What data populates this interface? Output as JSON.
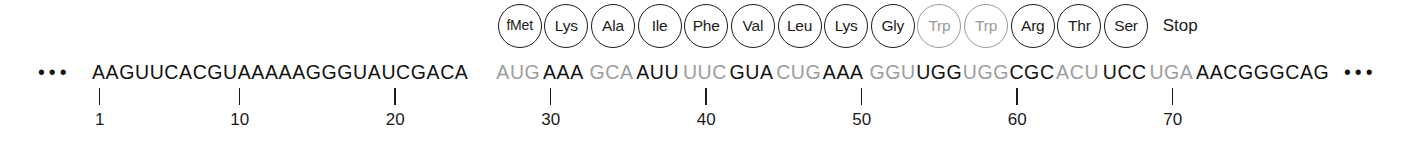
{
  "figure": {
    "leading_ellipsis": "•••",
    "trailing_ellipsis": "•••",
    "stop_label": "Stop",
    "colors": {
      "ink": "#121212",
      "gray": "#9d9d9d",
      "background": "#ffffff"
    }
  },
  "chart_data": {
    "type": "table",
    "xlabel": "Nucleotide position",
    "ylabel": "",
    "grid": false,
    "legend": "none",
    "xlim": [
      1,
      80
    ],
    "sequence_full": "AAGUUCACGUAAAAAGGGUAUCGACAAUGAAAGCAAUUUUCGUACUGAAAGGUUGGUGGCGCACUUCCUGAAACGGGCAG",
    "sequence_length": 80,
    "reading_frame_start": 27,
    "reading_frame_end": 71,
    "segments": [
      {
        "text": "AAGUUCACGUAAAAAGGGUAUCGACA",
        "color": "black",
        "start": 1,
        "end": 26,
        "kind": "utr"
      },
      {
        "text": "AUG",
        "color": "gray",
        "start": 27,
        "end": 29,
        "kind": "codon",
        "amino_acid": "fMet"
      },
      {
        "text": "AAA",
        "color": "black",
        "start": 30,
        "end": 32,
        "kind": "codon",
        "amino_acid": "Lys"
      },
      {
        "text": "GCA",
        "color": "gray",
        "start": 33,
        "end": 35,
        "kind": "codon",
        "amino_acid": "Ala"
      },
      {
        "text": "AUU",
        "color": "black",
        "start": 36,
        "end": 38,
        "kind": "codon",
        "amino_acid": "Ile"
      },
      {
        "text": "UUC",
        "color": "gray",
        "start": 39,
        "end": 41,
        "kind": "codon",
        "amino_acid": "Phe"
      },
      {
        "text": "GUA",
        "color": "black",
        "start": 42,
        "end": 44,
        "kind": "codon",
        "amino_acid": "Val"
      },
      {
        "text": "CUG",
        "color": "gray",
        "start": 45,
        "end": 47,
        "kind": "codon",
        "amino_acid": "Leu"
      },
      {
        "text": "AAA",
        "color": "black",
        "start": 48,
        "end": 50,
        "kind": "codon",
        "amino_acid": "Lys"
      },
      {
        "text": "GGU",
        "color": "gray",
        "start": 51,
        "end": 53,
        "kind": "codon",
        "amino_acid": "Gly"
      },
      {
        "text": "UGG",
        "color": "black",
        "start": 54,
        "end": 56,
        "kind": "codon",
        "amino_acid": "Trp"
      },
      {
        "text": "UGG",
        "color": "gray",
        "start": 57,
        "end": 59,
        "kind": "codon",
        "amino_acid": "Trp"
      },
      {
        "text": "CGC",
        "color": "black",
        "start": 60,
        "end": 62,
        "kind": "codon",
        "amino_acid": "Arg"
      },
      {
        "text": "ACU",
        "color": "gray",
        "start": 63,
        "end": 65,
        "kind": "codon",
        "amino_acid": "Thr"
      },
      {
        "text": "UCC",
        "color": "black",
        "start": 66,
        "end": 68,
        "kind": "codon",
        "amino_acid": "Ser"
      },
      {
        "text": "UGA",
        "color": "gray",
        "start": 69,
        "end": 71,
        "kind": "codon",
        "amino_acid": "Stop"
      },
      {
        "text": "AACGGGCAG",
        "color": "black",
        "start": 72,
        "end": 80,
        "kind": "utr"
      }
    ],
    "amino_acids": [
      {
        "label": "fMet",
        "color": "black",
        "codon": "AUG",
        "codon_start": 27
      },
      {
        "label": "Lys",
        "color": "black",
        "codon": "AAA",
        "codon_start": 30
      },
      {
        "label": "Ala",
        "color": "black",
        "codon": "GCA",
        "codon_start": 33
      },
      {
        "label": "Ile",
        "color": "black",
        "codon": "AUU",
        "codon_start": 36
      },
      {
        "label": "Phe",
        "color": "black",
        "codon": "UUC",
        "codon_start": 39
      },
      {
        "label": "Val",
        "color": "black",
        "codon": "GUA",
        "codon_start": 42
      },
      {
        "label": "Leu",
        "color": "black",
        "codon": "CUG",
        "codon_start": 45
      },
      {
        "label": "Lys",
        "color": "black",
        "codon": "AAA",
        "codon_start": 48
      },
      {
        "label": "Gly",
        "color": "black",
        "codon": "GGU",
        "codon_start": 51
      },
      {
        "label": "Trp",
        "color": "gray",
        "codon": "UGG",
        "codon_start": 54
      },
      {
        "label": "Trp",
        "color": "gray",
        "codon": "UGG",
        "codon_start": 57
      },
      {
        "label": "Arg",
        "color": "black",
        "codon": "CGC",
        "codon_start": 60
      },
      {
        "label": "Thr",
        "color": "black",
        "codon": "ACU",
        "codon_start": 63
      },
      {
        "label": "Ser",
        "color": "black",
        "codon": "UCC",
        "codon_start": 66
      }
    ],
    "ticks": [
      {
        "label": "1",
        "position": 1
      },
      {
        "label": "10",
        "position": 10
      },
      {
        "label": "20",
        "position": 20
      },
      {
        "label": "30",
        "position": 30
      },
      {
        "label": "40",
        "position": 40
      },
      {
        "label": "50",
        "position": 50
      },
      {
        "label": "60",
        "position": 60
      },
      {
        "label": "70",
        "position": 70
      }
    ]
  },
  "layout": {
    "seq_left": 92,
    "char_width": 15.55
  }
}
